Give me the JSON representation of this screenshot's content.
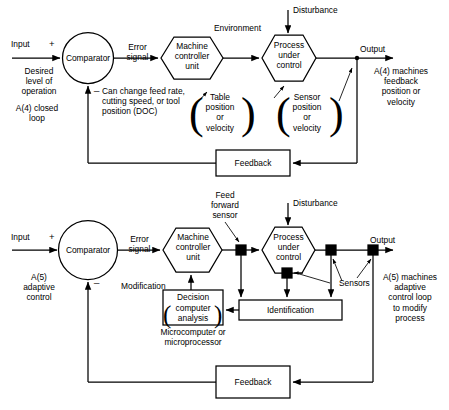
{
  "diagram": {
    "type": "block-diagram",
    "line_color": "#000000",
    "text_color": "#000000",
    "background": "#ffffff"
  },
  "top": {
    "caption_id": "A(4) closed loop",
    "input_label": "Input",
    "plus_sign": "+",
    "minus_sign": "_",
    "desired_level": "Desired\nlevel of\noperation",
    "side_note": "A(4) closed\nloop",
    "comparator": "Comparator",
    "error_signal": "Error\nsignal",
    "machine_unit": "Machine\ncontroller\nunit",
    "environment": "Environment",
    "disturbance": "Disturbance",
    "process": "Process\nunder\ncontrol",
    "output_label": "Output",
    "output_note": "A(4) machines\nfeedback\nposition or\nvelocity",
    "change_note": "Can change feed rate,\ncutting speed, or tool\nposition (DOC)",
    "table_bracket": "Table\nposition\nor\nvelocity",
    "sensor_bracket": "Sensor\nposition\nor\nvelocity",
    "feedback": "Feedback"
  },
  "bottom": {
    "caption_id": "A(5) adaptive control",
    "input_label": "Input",
    "plus_sign": "+",
    "minus_sign": "_",
    "side_note": "A(5)\nadaptive\ncontrol",
    "comparator": "Comparator",
    "error_signal": "Error\nsignal",
    "machine_unit": "Machine\ncontroller\nunit",
    "feed_forward_sensor": "Feed\nforward\nsensor",
    "disturbance": "Disturbance",
    "process": "Process\nunder\ncontrol",
    "output_label": "Output",
    "output_note": "A(5) machines\nadaptive\ncontrol loop\nto modify\nprocess",
    "modification": "Modification",
    "decision": "Decision",
    "decision_paren": "computer\nanalysis",
    "micro_note": "Microcomputer or\nmicroprocessor",
    "identification": "Identification",
    "sensors": "Sensors",
    "feedback": "Feedback"
  }
}
